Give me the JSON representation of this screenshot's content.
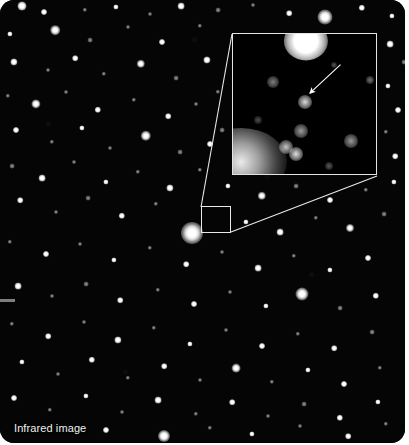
{
  "figure": {
    "caption": "Infrared image",
    "plate": {
      "background_color": "#000000",
      "page_background": "#ffffff",
      "width": 405,
      "height": 443,
      "corner_radius": 14
    }
  },
  "annotations": {
    "source_box": {
      "name": "source-region-box",
      "x": 201,
      "y": 206,
      "width": 30,
      "height": 27,
      "stroke_color": "#e9e9e9"
    },
    "inset": {
      "name": "magnified-inset",
      "x": 232,
      "y": 33,
      "width": 145,
      "height": 142,
      "stroke_color": "#e4e4e4",
      "label": "magnified view of boxed region"
    },
    "leader_lines": [
      {
        "name": "leader-line-upper",
        "x1": 201,
        "y1": 207,
        "x2": 232,
        "y2": 34
      },
      {
        "name": "leader-line-lower",
        "x1": 231,
        "y1": 232,
        "x2": 377,
        "y2": 176
      }
    ],
    "arrow": {
      "name": "target-pointer-arrow",
      "x1": 341,
      "y1": 64,
      "x2": 310,
      "y2": 93,
      "color": "#ffffff",
      "points_at": "candidate source"
    },
    "edge_tick": {
      "name": "left-edge-tick",
      "x": 0,
      "y": 299,
      "width": 15,
      "height": 3,
      "color": "#7e7e7e"
    }
  },
  "inset_content": {
    "background_color": "#000000",
    "bright_blob_top": {
      "cx": 73,
      "cy": 7,
      "r": 17,
      "name": "saturated-star-top"
    },
    "diffuse_glow": {
      "cx": 8,
      "cy": 128,
      "rx": 46,
      "ry": 34,
      "name": "diffuse-nebulosity"
    },
    "candidate_object": {
      "cx": 72,
      "cy": 68,
      "r": 7,
      "name": "candidate-source"
    },
    "sources": [
      {
        "cx": 40,
        "cy": 48,
        "r": 6,
        "i": 0.5
      },
      {
        "cx": 72,
        "cy": 68,
        "r": 7,
        "i": 0.86
      },
      {
        "cx": 68,
        "cy": 97,
        "r": 7,
        "i": 0.62
      },
      {
        "cx": 53,
        "cy": 113,
        "r": 7,
        "i": 0.78
      },
      {
        "cx": 63,
        "cy": 120,
        "r": 7,
        "i": 0.88
      },
      {
        "cx": 118,
        "cy": 107,
        "r": 7,
        "i": 0.6
      },
      {
        "cx": 137,
        "cy": 46,
        "r": 4,
        "i": 0.45
      },
      {
        "cx": 101,
        "cy": 31,
        "r": 3,
        "i": 0.34
      },
      {
        "cx": 25,
        "cy": 86,
        "r": 4,
        "i": 0.3
      },
      {
        "cx": 96,
        "cy": 132,
        "r": 4,
        "i": 0.35
      }
    ]
  },
  "stars": [
    {
      "cx": 22,
      "cy": 6,
      "r": 4.5,
      "k": "soft"
    },
    {
      "cx": 44,
      "cy": 12,
      "r": 3.0,
      "k": "soft"
    },
    {
      "cx": 85,
      "cy": 10,
      "r": 2.2,
      "k": "faint"
    },
    {
      "cx": 116,
      "cy": 7,
      "r": 2.6,
      "k": "soft"
    },
    {
      "cx": 150,
      "cy": 14,
      "r": 2.0,
      "k": "faint"
    },
    {
      "cx": 181,
      "cy": 6,
      "r": 3.4,
      "k": "soft"
    },
    {
      "cx": 218,
      "cy": 10,
      "r": 2.4,
      "k": "faint"
    },
    {
      "cx": 253,
      "cy": 5,
      "r": 2.0,
      "k": "faint"
    },
    {
      "cx": 289,
      "cy": 13,
      "r": 2.8,
      "k": "soft"
    },
    {
      "cx": 325,
      "cy": 17,
      "r": 7.5,
      "k": "halo"
    },
    {
      "cx": 362,
      "cy": 8,
      "r": 3.2,
      "k": "soft"
    },
    {
      "cx": 392,
      "cy": 16,
      "r": 2.6,
      "k": "soft"
    },
    {
      "cx": 10,
      "cy": 34,
      "r": 2.6,
      "k": "soft"
    },
    {
      "cx": 55,
      "cy": 30,
      "r": 4.8,
      "k": "halo"
    },
    {
      "cx": 90,
      "cy": 40,
      "r": 2.4,
      "k": "faint"
    },
    {
      "cx": 128,
      "cy": 27,
      "r": 2.0,
      "k": "faint"
    },
    {
      "cx": 162,
      "cy": 42,
      "r": 3.0,
      "k": "soft"
    },
    {
      "cx": 200,
      "cy": 26,
      "r": 2.2,
      "k": "faint"
    },
    {
      "cx": 390,
      "cy": 44,
      "r": 3.4,
      "k": "soft"
    },
    {
      "cx": 404,
      "cy": 62,
      "r": 2.4,
      "k": "faint"
    },
    {
      "cx": 14,
      "cy": 62,
      "r": 3.6,
      "k": "soft"
    },
    {
      "cx": 48,
      "cy": 70,
      "r": 2.0,
      "k": "faint"
    },
    {
      "cx": 75,
      "cy": 58,
      "r": 2.8,
      "k": "soft"
    },
    {
      "cx": 104,
      "cy": 74,
      "r": 2.2,
      "k": "faint"
    },
    {
      "cx": 141,
      "cy": 64,
      "r": 4.2,
      "k": "halo"
    },
    {
      "cx": 176,
      "cy": 78,
      "r": 2.4,
      "k": "faint"
    },
    {
      "cx": 207,
      "cy": 60,
      "r": 3.6,
      "k": "soft"
    },
    {
      "cx": 218,
      "cy": 92,
      "r": 2.2,
      "k": "faint"
    },
    {
      "cx": 388,
      "cy": 86,
      "r": 2.6,
      "k": "soft"
    },
    {
      "cx": 398,
      "cy": 110,
      "r": 3.0,
      "k": "soft"
    },
    {
      "cx": 8,
      "cy": 96,
      "r": 2.2,
      "k": "faint"
    },
    {
      "cx": 36,
      "cy": 104,
      "r": 4.6,
      "k": "halo"
    },
    {
      "cx": 66,
      "cy": 92,
      "r": 2.0,
      "k": "faint"
    },
    {
      "cx": 98,
      "cy": 110,
      "r": 3.2,
      "k": "soft"
    },
    {
      "cx": 134,
      "cy": 100,
      "r": 2.2,
      "k": "faint"
    },
    {
      "cx": 168,
      "cy": 116,
      "r": 2.8,
      "k": "soft"
    },
    {
      "cx": 196,
      "cy": 104,
      "r": 2.0,
      "k": "faint"
    },
    {
      "cx": 222,
      "cy": 130,
      "r": 2.4,
      "k": "faint"
    },
    {
      "cx": 386,
      "cy": 132,
      "r": 2.2,
      "k": "faint"
    },
    {
      "cx": 16,
      "cy": 130,
      "r": 3.0,
      "k": "soft"
    },
    {
      "cx": 52,
      "cy": 142,
      "r": 2.2,
      "k": "faint"
    },
    {
      "cx": 82,
      "cy": 128,
      "r": 2.6,
      "k": "soft"
    },
    {
      "cx": 110,
      "cy": 148,
      "r": 2.0,
      "k": "faint"
    },
    {
      "cx": 146,
      "cy": 136,
      "r": 5.2,
      "k": "halo"
    },
    {
      "cx": 180,
      "cy": 152,
      "r": 2.4,
      "k": "faint"
    },
    {
      "cx": 210,
      "cy": 144,
      "r": 3.0,
      "k": "soft"
    },
    {
      "cx": 395,
      "cy": 156,
      "r": 2.8,
      "k": "soft"
    },
    {
      "cx": 12,
      "cy": 166,
      "r": 2.4,
      "k": "faint"
    },
    {
      "cx": 42,
      "cy": 178,
      "r": 3.4,
      "k": "soft"
    },
    {
      "cx": 74,
      "cy": 162,
      "r": 2.0,
      "k": "faint"
    },
    {
      "cx": 106,
      "cy": 182,
      "r": 2.6,
      "k": "soft"
    },
    {
      "cx": 138,
      "cy": 172,
      "r": 2.2,
      "k": "faint"
    },
    {
      "cx": 170,
      "cy": 188,
      "r": 3.6,
      "k": "soft"
    },
    {
      "cx": 200,
      "cy": 170,
      "r": 2.2,
      "k": "faint"
    },
    {
      "cx": 228,
      "cy": 186,
      "r": 2.6,
      "k": "soft"
    },
    {
      "cx": 262,
      "cy": 196,
      "r": 4.2,
      "k": "halo"
    },
    {
      "cx": 296,
      "cy": 186,
      "r": 2.4,
      "k": "faint"
    },
    {
      "cx": 330,
      "cy": 200,
      "r": 3.0,
      "k": "soft"
    },
    {
      "cx": 366,
      "cy": 190,
      "r": 2.2,
      "k": "faint"
    },
    {
      "cx": 394,
      "cy": 182,
      "r": 2.6,
      "k": "soft"
    },
    {
      "cx": 20,
      "cy": 200,
      "r": 2.8,
      "k": "soft"
    },
    {
      "cx": 56,
      "cy": 212,
      "r": 2.0,
      "k": "faint"
    },
    {
      "cx": 88,
      "cy": 198,
      "r": 2.4,
      "k": "faint"
    },
    {
      "cx": 122,
      "cy": 216,
      "r": 3.2,
      "k": "soft"
    },
    {
      "cx": 156,
      "cy": 204,
      "r": 2.2,
      "k": "faint"
    },
    {
      "cx": 192,
      "cy": 233,
      "r": 11.0,
      "k": "halo"
    },
    {
      "cx": 246,
      "cy": 222,
      "r": 2.6,
      "k": "soft"
    },
    {
      "cx": 280,
      "cy": 232,
      "r": 3.4,
      "k": "soft"
    },
    {
      "cx": 316,
      "cy": 218,
      "r": 2.2,
      "k": "faint"
    },
    {
      "cx": 350,
      "cy": 228,
      "r": 4.0,
      "k": "halo"
    },
    {
      "cx": 384,
      "cy": 214,
      "r": 2.4,
      "k": "faint"
    },
    {
      "cx": 10,
      "cy": 242,
      "r": 2.2,
      "k": "faint"
    },
    {
      "cx": 46,
      "cy": 254,
      "r": 3.0,
      "k": "soft"
    },
    {
      "cx": 80,
      "cy": 244,
      "r": 2.0,
      "k": "faint"
    },
    {
      "cx": 114,
      "cy": 260,
      "r": 2.6,
      "k": "soft"
    },
    {
      "cx": 150,
      "cy": 248,
      "r": 2.2,
      "k": "faint"
    },
    {
      "cx": 186,
      "cy": 264,
      "r": 2.8,
      "k": "soft"
    },
    {
      "cx": 222,
      "cy": 252,
      "r": 2.0,
      "k": "faint"
    },
    {
      "cx": 258,
      "cy": 268,
      "r": 3.4,
      "k": "soft"
    },
    {
      "cx": 294,
      "cy": 256,
      "r": 2.2,
      "k": "faint"
    },
    {
      "cx": 330,
      "cy": 270,
      "r": 2.6,
      "k": "soft"
    },
    {
      "cx": 368,
      "cy": 258,
      "r": 3.0,
      "k": "soft"
    },
    {
      "cx": 18,
      "cy": 286,
      "r": 3.4,
      "k": "soft"
    },
    {
      "cx": 52,
      "cy": 296,
      "r": 2.0,
      "k": "faint"
    },
    {
      "cx": 86,
      "cy": 284,
      "r": 2.4,
      "k": "faint"
    },
    {
      "cx": 120,
      "cy": 300,
      "r": 2.8,
      "k": "soft"
    },
    {
      "cx": 158,
      "cy": 290,
      "r": 2.2,
      "k": "faint"
    },
    {
      "cx": 194,
      "cy": 304,
      "r": 3.0,
      "k": "soft"
    },
    {
      "cx": 230,
      "cy": 292,
      "r": 2.0,
      "k": "faint"
    },
    {
      "cx": 266,
      "cy": 306,
      "r": 2.6,
      "k": "soft"
    },
    {
      "cx": 302,
      "cy": 294,
      "r": 6.5,
      "k": "halo"
    },
    {
      "cx": 340,
      "cy": 308,
      "r": 2.4,
      "k": "faint"
    },
    {
      "cx": 376,
      "cy": 296,
      "r": 3.2,
      "k": "soft"
    },
    {
      "cx": 12,
      "cy": 324,
      "r": 2.2,
      "k": "faint"
    },
    {
      "cx": 48,
      "cy": 336,
      "r": 2.8,
      "k": "soft"
    },
    {
      "cx": 84,
      "cy": 322,
      "r": 2.0,
      "k": "faint"
    },
    {
      "cx": 118,
      "cy": 340,
      "r": 3.6,
      "k": "soft"
    },
    {
      "cx": 154,
      "cy": 328,
      "r": 2.2,
      "k": "faint"
    },
    {
      "cx": 190,
      "cy": 344,
      "r": 2.6,
      "k": "soft"
    },
    {
      "cx": 226,
      "cy": 330,
      "r": 2.0,
      "k": "faint"
    },
    {
      "cx": 262,
      "cy": 346,
      "r": 3.0,
      "k": "soft"
    },
    {
      "cx": 298,
      "cy": 334,
      "r": 2.2,
      "k": "faint"
    },
    {
      "cx": 334,
      "cy": 348,
      "r": 2.8,
      "k": "soft"
    },
    {
      "cx": 372,
      "cy": 332,
      "r": 2.4,
      "k": "faint"
    },
    {
      "cx": 22,
      "cy": 362,
      "r": 2.6,
      "k": "soft"
    },
    {
      "cx": 58,
      "cy": 374,
      "r": 2.0,
      "k": "faint"
    },
    {
      "cx": 92,
      "cy": 360,
      "r": 3.2,
      "k": "soft"
    },
    {
      "cx": 128,
      "cy": 378,
      "r": 2.2,
      "k": "faint"
    },
    {
      "cx": 164,
      "cy": 366,
      "r": 2.8,
      "k": "soft"
    },
    {
      "cx": 200,
      "cy": 380,
      "r": 2.0,
      "k": "faint"
    },
    {
      "cx": 236,
      "cy": 368,
      "r": 4.4,
      "k": "halo"
    },
    {
      "cx": 272,
      "cy": 382,
      "r": 2.2,
      "k": "faint"
    },
    {
      "cx": 308,
      "cy": 370,
      "r": 2.6,
      "k": "soft"
    },
    {
      "cx": 344,
      "cy": 384,
      "r": 3.0,
      "k": "soft"
    },
    {
      "cx": 380,
      "cy": 368,
      "r": 2.2,
      "k": "faint"
    },
    {
      "cx": 14,
      "cy": 398,
      "r": 3.0,
      "k": "soft"
    },
    {
      "cx": 50,
      "cy": 410,
      "r": 2.2,
      "k": "faint"
    },
    {
      "cx": 86,
      "cy": 396,
      "r": 2.6,
      "k": "soft"
    },
    {
      "cx": 122,
      "cy": 412,
      "r": 2.0,
      "k": "faint"
    },
    {
      "cx": 158,
      "cy": 400,
      "r": 3.4,
      "k": "soft"
    },
    {
      "cx": 196,
      "cy": 414,
      "r": 2.2,
      "k": "faint"
    },
    {
      "cx": 232,
      "cy": 402,
      "r": 2.8,
      "k": "soft"
    },
    {
      "cx": 268,
      "cy": 416,
      "r": 2.0,
      "k": "faint"
    },
    {
      "cx": 304,
      "cy": 404,
      "r": 2.4,
      "k": "faint"
    },
    {
      "cx": 340,
      "cy": 418,
      "r": 3.2,
      "k": "soft"
    },
    {
      "cx": 378,
      "cy": 402,
      "r": 2.6,
      "k": "soft"
    },
    {
      "cx": 106,
      "cy": 430,
      "r": 3.0,
      "k": "soft"
    },
    {
      "cx": 164,
      "cy": 436,
      "r": 6.0,
      "k": "halo"
    },
    {
      "cx": 210,
      "cy": 428,
      "r": 2.2,
      "k": "faint"
    },
    {
      "cx": 252,
      "cy": 434,
      "r": 2.6,
      "k": "soft"
    },
    {
      "cx": 300,
      "cy": 426,
      "r": 2.0,
      "k": "faint"
    },
    {
      "cx": 348,
      "cy": 436,
      "r": 2.8,
      "k": "soft"
    },
    {
      "cx": 386,
      "cy": 424,
      "r": 2.2,
      "k": "faint"
    }
  ]
}
